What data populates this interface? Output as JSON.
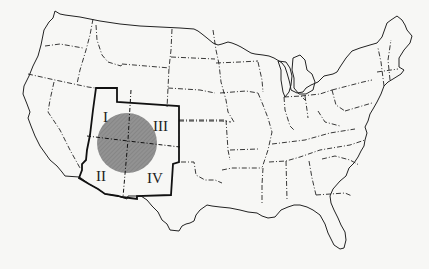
{
  "map": {
    "type": "outline-map",
    "subject": "Contiguous United States with Four Corners region highlighted",
    "colors": {
      "background": "#f7f7f5",
      "outline": "#222222",
      "circle_fill": "#8c8c8c",
      "region_border": "#111111"
    },
    "quadrant_labels": [
      {
        "id": "I",
        "label": "I"
      },
      {
        "id": "II",
        "label": "II"
      },
      {
        "id": "III",
        "label": "III"
      },
      {
        "id": "IV",
        "label": "IV"
      }
    ],
    "highlight_circle": {
      "cx": 127,
      "cy": 143,
      "r": 30,
      "pattern": "hatched gray"
    }
  }
}
